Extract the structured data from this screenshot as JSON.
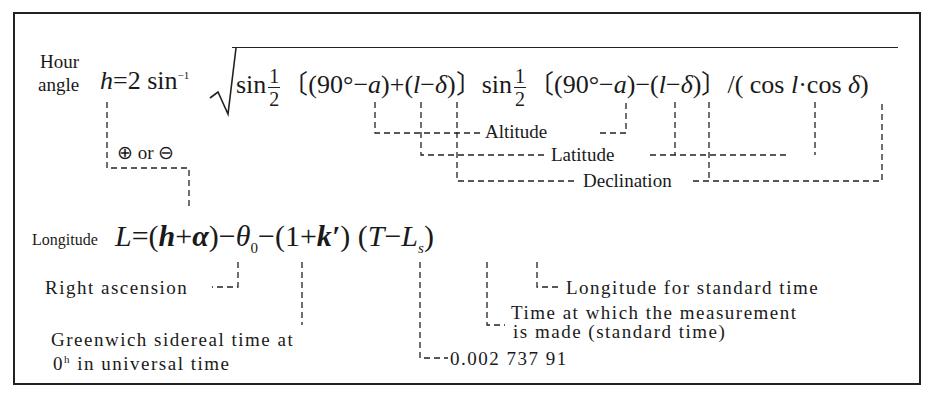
{
  "hour_angle": {
    "label_line1": "Hour",
    "label_line2": "angle",
    "lhs": "h",
    "eq": "=2 sin",
    "inv": "−1",
    "sin1": "sin",
    "half_num": "1",
    "half_den": "2",
    "part1": "〔(90°−",
    "a1": "a",
    "part2": ")+(",
    "l1": "l",
    "minus1": "−",
    "d1": "δ",
    "part3": ")〕sin",
    "part4": "〔(90°−",
    "a2": "a",
    "part5": ")−(",
    "l2": "l",
    "minus2": "−",
    "d2": "δ",
    "part6": ")〕/( cos ",
    "l3": "l",
    "dot": "·cos ",
    "d3": "δ",
    "close": ")"
  },
  "annotations_top": {
    "plus_or_minus": "⊕ or ⊖",
    "altitude": "Altitude",
    "latitude": "Latitude",
    "declination": "Declination"
  },
  "longitude": {
    "label": "Longitude",
    "lhs": "L",
    "eq": "=(",
    "h": "h",
    "plus": "+",
    "alpha": "α",
    "p1": ")−",
    "theta": "θ",
    "theta_sub": "0",
    "p2": "−(1+",
    "k": "k′",
    "p3": ") (",
    "T": "T",
    "minus": "−",
    "Ls": "L",
    "Ls_sub": "s",
    "close": ")"
  },
  "annotations_bottom": {
    "right_ascension": "Right ascension",
    "greenwich_line1": "Greenwich sidereal time at",
    "greenwich_line2_prefix": "0",
    "greenwich_line2_sup": "h",
    "greenwich_line2_rest": " in universal time",
    "k_value": "0.002 737 91",
    "time_line1": "Time at which the measurement",
    "time_line2": "is made (standard time)",
    "longitude_standard": "Longitude for standard time"
  }
}
